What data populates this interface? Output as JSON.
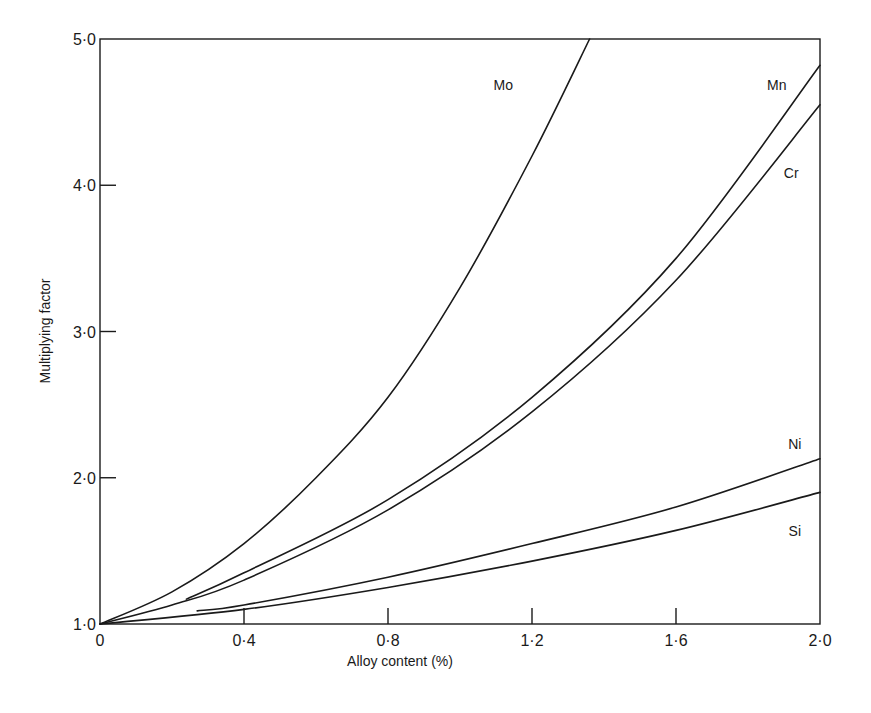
{
  "chart_data": {
    "type": "line",
    "title": "",
    "xlabel": "Alloy content (%)",
    "ylabel": "Multiplying factor",
    "xlim": [
      0,
      2.0
    ],
    "ylim": [
      1.0,
      5.0
    ],
    "grid": false,
    "legend_position": "inline labels at curve ends",
    "x_ticks": [
      {
        "value": 0,
        "label": "0"
      },
      {
        "value": 0.4,
        "label": "0·4"
      },
      {
        "value": 0.8,
        "label": "0·8"
      },
      {
        "value": 1.2,
        "label": "1·2"
      },
      {
        "value": 1.6,
        "label": "1·6"
      },
      {
        "value": 2.0,
        "label": "2·0"
      }
    ],
    "y_ticks": [
      {
        "value": 1.0,
        "label": "1·0"
      },
      {
        "value": 2.0,
        "label": "2·0"
      },
      {
        "value": 3.0,
        "label": "3·0"
      },
      {
        "value": 4.0,
        "label": "4·0"
      },
      {
        "value": 5.0,
        "label": "5·0"
      }
    ],
    "series": [
      {
        "name": "Mo",
        "x": [
          0,
          0.2,
          0.4,
          0.6,
          0.8,
          1.0,
          1.2,
          1.36
        ],
        "y": [
          1.0,
          1.22,
          1.55,
          2.0,
          2.55,
          3.3,
          4.2,
          5.0
        ]
      },
      {
        "name": "Mn",
        "x": [
          0.24,
          0.4,
          0.8,
          1.2,
          1.6,
          2.0
        ],
        "y": [
          1.17,
          1.35,
          1.85,
          2.55,
          3.5,
          4.82
        ]
      },
      {
        "name": "Cr",
        "x": [
          0,
          0.2,
          0.4,
          0.8,
          1.2,
          1.6,
          2.0
        ],
        "y": [
          1.0,
          1.13,
          1.3,
          1.78,
          2.45,
          3.35,
          4.55
        ]
      },
      {
        "name": "Ni",
        "x": [
          0.27,
          0.4,
          0.8,
          1.2,
          1.6,
          2.0
        ],
        "y": [
          1.09,
          1.13,
          1.32,
          1.55,
          1.8,
          2.13
        ]
      },
      {
        "name": "Si",
        "x": [
          0,
          0.4,
          0.8,
          1.2,
          1.6,
          2.0
        ],
        "y": [
          1.0,
          1.1,
          1.25,
          1.43,
          1.64,
          1.9
        ]
      }
    ],
    "annotations": [
      {
        "text": "Mo",
        "x": 1.12,
        "y": 4.65
      },
      {
        "text": "Mn",
        "x": 1.88,
        "y": 4.65
      },
      {
        "text": "Cr",
        "x": 1.92,
        "y": 4.05
      },
      {
        "text": "Ni",
        "x": 1.93,
        "y": 2.2
      },
      {
        "text": "Si",
        "x": 1.93,
        "y": 1.6
      }
    ]
  },
  "colors": {
    "line": "#1a1a1a",
    "background": "#ffffff"
  }
}
